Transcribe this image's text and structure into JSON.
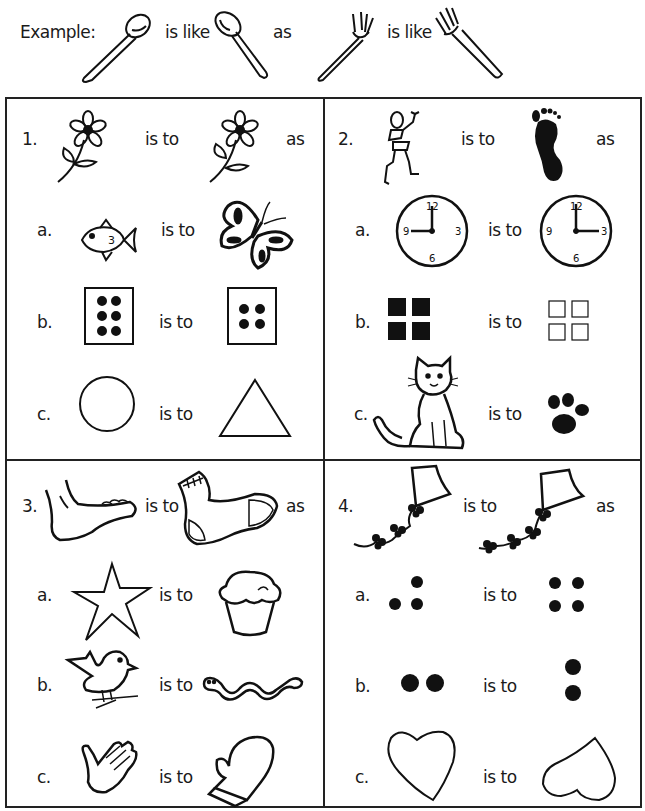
{
  "example": {
    "label": "Example:",
    "relation": "is like",
    "connector": "as",
    "items": [
      "spoon-tilted",
      "spoon-mirrored",
      "fork-tilted",
      "fork-mirrored"
    ]
  },
  "relations": {
    "is_to": "is to",
    "as": "as"
  },
  "problems": [
    {
      "number": "1.",
      "pair": [
        "flower",
        "flower-flipped"
      ],
      "options": [
        {
          "letter": "a.",
          "pair": [
            "fish",
            "butterfly"
          ]
        },
        {
          "letter": "b.",
          "pair": [
            "die-six-dots",
            "die-four-dots"
          ]
        },
        {
          "letter": "c.",
          "pair": [
            "circle",
            "triangle"
          ]
        }
      ]
    },
    {
      "number": "2.",
      "pair": [
        "stick-figure",
        "footprint"
      ],
      "options": [
        {
          "letter": "a.",
          "pair": [
            "clock-9-oclock",
            "clock-3-oclock"
          ]
        },
        {
          "letter": "b.",
          "pair": [
            "four-filled-squares",
            "four-empty-squares"
          ]
        },
        {
          "letter": "c.",
          "pair": [
            "cat",
            "paw-print"
          ]
        }
      ]
    },
    {
      "number": "3.",
      "pair": [
        "foot",
        "sock"
      ],
      "options": [
        {
          "letter": "a.",
          "pair": [
            "star",
            "cupcake"
          ]
        },
        {
          "letter": "b.",
          "pair": [
            "bird",
            "worm"
          ]
        },
        {
          "letter": "c.",
          "pair": [
            "hand",
            "mitten"
          ]
        }
      ]
    },
    {
      "number": "4.",
      "pair": [
        "kite-three-bows",
        "kite-four-bows"
      ],
      "options": [
        {
          "letter": "a.",
          "pair": [
            "three-dots",
            "four-dots"
          ]
        },
        {
          "letter": "b.",
          "pair": [
            "two-dots-horizontal",
            "two-dots-vertical"
          ]
        },
        {
          "letter": "c.",
          "pair": [
            "heart",
            "heart-upside-down"
          ]
        }
      ]
    }
  ],
  "colors": {
    "ink": "#111111",
    "paper": "#ffffff"
  }
}
